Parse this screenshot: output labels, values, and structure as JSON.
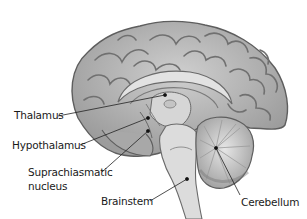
{
  "diagram": {
    "labels": [
      {
        "id": "thalamus",
        "text": "Thalamus"
      },
      {
        "id": "hypothalamus",
        "text": "Hypothalamus"
      },
      {
        "id": "suprachiasmatic",
        "line1": "Suprachiasmatic",
        "line2": "nucleus"
      },
      {
        "id": "brainstem",
        "text": "Brainstem"
      },
      {
        "id": "cerebellum",
        "text": "Cerebellum"
      }
    ],
    "colors": {
      "cortex_fill": "#b9b9b9",
      "cortex_dark": "#6e6e6e",
      "inner_light": "#d8d8d8",
      "leader_line": "#222222",
      "background": "#ffffff"
    }
  }
}
